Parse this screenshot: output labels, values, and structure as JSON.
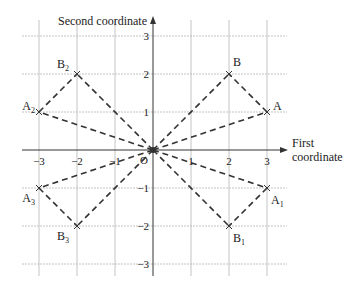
{
  "diagram": {
    "type": "coordinate-plane",
    "axes": {
      "x_label_line1": "First",
      "x_label_line2": "coordinate",
      "y_label": "Second coordinate",
      "origin_label": "O",
      "x_range": [
        -3,
        3
      ],
      "y_range": [
        -3,
        3
      ],
      "x_ticks": [
        {
          "value": -3,
          "label": "−3"
        },
        {
          "value": -2,
          "label": "−2"
        },
        {
          "value": -1,
          "label": "−1"
        },
        {
          "value": 1,
          "label": "1"
        },
        {
          "value": 2,
          "label": "2"
        },
        {
          "value": 3,
          "label": "3"
        }
      ],
      "y_ticks": [
        {
          "value": 3,
          "label": "3"
        },
        {
          "value": 2,
          "label": "2"
        },
        {
          "value": 1,
          "label": "1"
        },
        {
          "value": -1,
          "label": "−1"
        },
        {
          "value": -2,
          "label": "−2"
        },
        {
          "value": -3,
          "label": "−3"
        }
      ]
    },
    "points": [
      {
        "id": "A",
        "name": "A",
        "sub": "",
        "x": 3,
        "y": 1,
        "label_pos": "right"
      },
      {
        "id": "B",
        "name": "B",
        "sub": "",
        "x": 2,
        "y": 2,
        "label_pos": "upper-right"
      },
      {
        "id": "A1",
        "name": "A",
        "sub": "1",
        "x": 3,
        "y": -1,
        "label_pos": "lower-right"
      },
      {
        "id": "B1",
        "name": "B",
        "sub": "1",
        "x": 2,
        "y": -2,
        "label_pos": "lower-right"
      },
      {
        "id": "A2",
        "name": "A",
        "sub": "2",
        "x": -3,
        "y": 1,
        "label_pos": "upper-left"
      },
      {
        "id": "B2",
        "name": "B",
        "sub": "2",
        "x": -2,
        "y": 2,
        "label_pos": "upper-left"
      },
      {
        "id": "A3",
        "name": "A",
        "sub": "3",
        "x": -3,
        "y": -1,
        "label_pos": "lower-left"
      },
      {
        "id": "B3",
        "name": "B",
        "sub": "3",
        "x": -2,
        "y": -2,
        "label_pos": "lower-left"
      }
    ],
    "dashed_segments": [
      [
        "O",
        "A"
      ],
      [
        "O",
        "B"
      ],
      [
        "A",
        "B"
      ],
      [
        "O",
        "A1"
      ],
      [
        "O",
        "B1"
      ],
      [
        "A1",
        "B1"
      ],
      [
        "O",
        "A2"
      ],
      [
        "O",
        "B2"
      ],
      [
        "A2",
        "B2"
      ],
      [
        "O",
        "A3"
      ],
      [
        "O",
        "B3"
      ],
      [
        "A3",
        "B3"
      ]
    ],
    "colors": {
      "grid": "#b5b5b5",
      "axis": "#333333",
      "dash": "#333333",
      "text": "#222222"
    }
  }
}
